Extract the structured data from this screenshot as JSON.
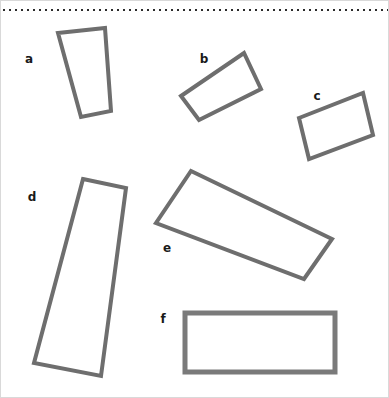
{
  "figure": {
    "width": 389,
    "height": 398,
    "background_color": "#ffffff",
    "border_color": "#d9d9d9"
  },
  "divider": {
    "name": "dotted-divider",
    "style": "dotted",
    "color": "#2b2b2b",
    "y": 9,
    "x_start": 2,
    "x_end": 387,
    "dot_size": 2,
    "dot_gap": 4
  },
  "labels": [
    {
      "text": "a",
      "x": 28,
      "y": 58
    },
    {
      "text": "b",
      "x": 203,
      "y": 58
    },
    {
      "text": "c",
      "x": 316,
      "y": 95
    },
    {
      "text": "d",
      "x": 31,
      "y": 196
    },
    {
      "text": "e",
      "x": 166,
      "y": 247
    },
    {
      "text": "f",
      "x": 162,
      "y": 318
    }
  ],
  "shapes": [
    {
      "id": "a",
      "name": "quadrilateral-a",
      "kind": "trapezoid",
      "stroke_color": "#6e6e6e",
      "stroke_width": 4,
      "points": "57,32 104,27 110,110 80,116"
    },
    {
      "id": "b",
      "name": "quadrilateral-b",
      "kind": "rotated-rectangle",
      "stroke_color": "#6e6e6e",
      "stroke_width": 4,
      "points": "180,95 243,52 260,88 198,119"
    },
    {
      "id": "c",
      "name": "quadrilateral-c",
      "kind": "rotated-rectangle",
      "stroke_color": "#6e6e6e",
      "stroke_width": 4,
      "points": "298,117 362,92 372,134 308,158"
    },
    {
      "id": "d",
      "name": "quadrilateral-d",
      "kind": "trapezoid",
      "stroke_color": "#6e6e6e",
      "stroke_width": 4,
      "points": "82,178 125,187 100,375 33,362"
    },
    {
      "id": "e",
      "name": "quadrilateral-e",
      "kind": "rotated-rectangle",
      "stroke_color": "#6e6e6e",
      "stroke_width": 4,
      "points": "190,170 331,238 303,278 155,222"
    },
    {
      "id": "f",
      "name": "quadrilateral-f",
      "kind": "rectangle",
      "stroke_color": "#7a7a7a",
      "stroke_width": 5,
      "points": "184,312 334,312 334,371 184,371"
    }
  ]
}
